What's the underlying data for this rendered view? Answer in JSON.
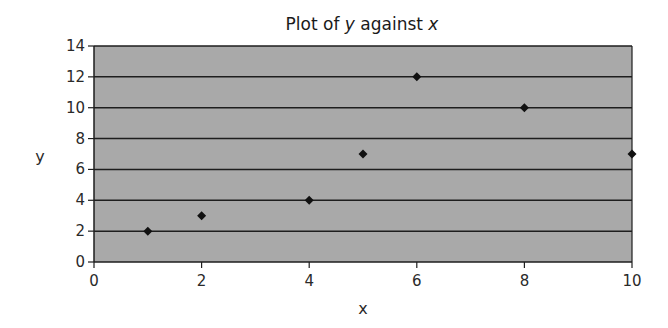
{
  "chart_data": {
    "type": "scatter",
    "title": "Plot of y against x",
    "title_parts": [
      {
        "text": "Plot of ",
        "italic": false
      },
      {
        "text": "y",
        "italic": true
      },
      {
        "text": " against ",
        "italic": false
      },
      {
        "text": "x",
        "italic": true
      }
    ],
    "xlabel": "x",
    "ylabel": "y",
    "xlim": [
      0,
      10
    ],
    "ylim": [
      0,
      14
    ],
    "xticks": [
      0,
      2,
      4,
      6,
      8,
      10
    ],
    "yticks": [
      0,
      2,
      4,
      6,
      8,
      10,
      12,
      14
    ],
    "grid": {
      "horizontal": true,
      "vertical": false
    },
    "legend": null,
    "marker": "diamond",
    "series": [
      {
        "name": "y",
        "x": [
          1,
          2,
          4,
          5,
          6,
          8,
          10
        ],
        "y": [
          2,
          3,
          4,
          7,
          12,
          10,
          7
        ]
      }
    ]
  },
  "colors": {
    "plot_background": "#a9a9a9",
    "gridline": "#1e1e1e",
    "marker": "#111111",
    "axis": "#1e1e1e"
  }
}
